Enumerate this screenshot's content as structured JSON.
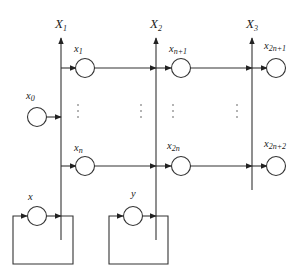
{
  "buses": [
    {
      "id": "X1",
      "label": "X",
      "sub": "1"
    },
    {
      "id": "X2",
      "label": "X",
      "sub": "2"
    },
    {
      "id": "X3",
      "label": "X",
      "sub": "3"
    }
  ],
  "nodes": {
    "x1": {
      "label": "x",
      "sub": "1"
    },
    "xn1": {
      "label": "x",
      "sub": "n+1"
    },
    "x2n1": {
      "label": "x",
      "sub": "2n+1"
    },
    "xn": {
      "label": "x",
      "sub": "n"
    },
    "x2n": {
      "label": "x",
      "sub": "2n"
    },
    "x2n2": {
      "label": "x",
      "sub": "2n+2"
    },
    "x0": {
      "label": "x",
      "sub": "0"
    },
    "x": {
      "label": "x",
      "sub": ""
    },
    "y": {
      "label": "y",
      "sub": ""
    }
  },
  "ellipsis": "⋮",
  "colors": {
    "stroke": "#333333",
    "background": "#ffffff"
  }
}
